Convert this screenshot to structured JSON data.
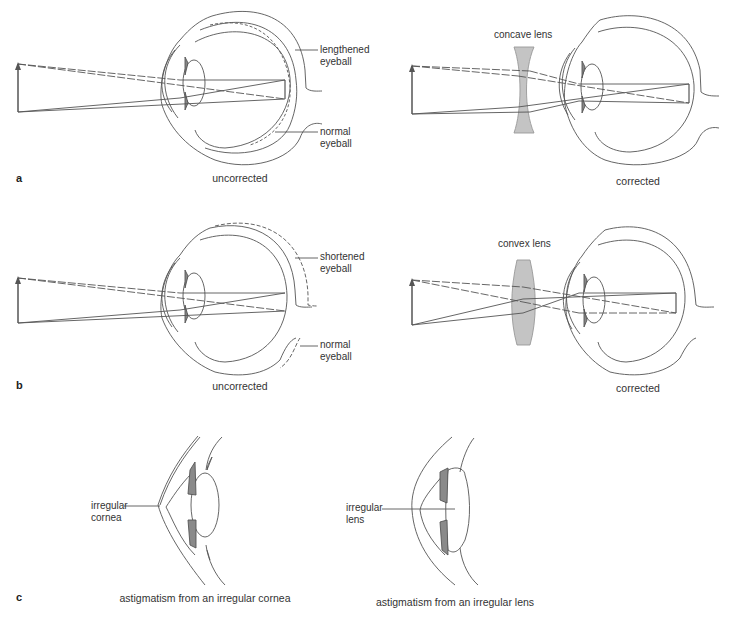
{
  "panels": {
    "a": {
      "letter": "a",
      "uncorrected": {
        "caption": "uncorrected",
        "label1": "lengthened\neyeball",
        "label1_a": "lengthened",
        "label1_b": "eyeball",
        "label2_a": "normal",
        "label2_b": "eyeball"
      },
      "corrected": {
        "caption": "corrected",
        "lens_label": "concave lens"
      }
    },
    "b": {
      "letter": "b",
      "uncorrected": {
        "caption": "uncorrected",
        "label1_a": "shortened",
        "label1_b": "eyeball",
        "label2_a": "normal",
        "label2_b": "eyeball"
      },
      "corrected": {
        "caption": "corrected",
        "lens_label": "convex lens"
      }
    },
    "c": {
      "letter": "c",
      "left": {
        "caption": "astigmatism from an irregular cornea",
        "label_a": "irregular",
        "label_b": "cornea"
      },
      "right": {
        "caption": "astigmatism from an irregular lens",
        "label_a": "irregular",
        "label_b": "lens"
      }
    }
  },
  "colors": {
    "line": "#444444",
    "lens_fill": "#c4c4c4",
    "iris_fill": "#8a8a8a",
    "arrow": "#555555"
  }
}
